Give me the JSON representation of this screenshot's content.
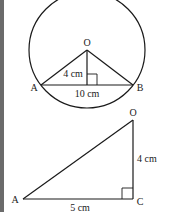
{
  "diagram_1": {
    "description": "Circle with center O, chord AB, perpendicular from O to AB",
    "points": {
      "O": "O",
      "A": "A",
      "B": "B"
    },
    "labels": {
      "perpendicular": "4 cm",
      "chord": "10 cm"
    }
  },
  "diagram_2": {
    "description": "Right triangle AOC with right angle at C",
    "points": {
      "O": "O",
      "A": "A",
      "C": "C"
    },
    "labels": {
      "vertical": "4 cm",
      "base": "5 cm"
    }
  },
  "colors": {
    "stroke": "#1a1a1a",
    "strip": "#6b6b6b",
    "background": "#ffffff"
  }
}
